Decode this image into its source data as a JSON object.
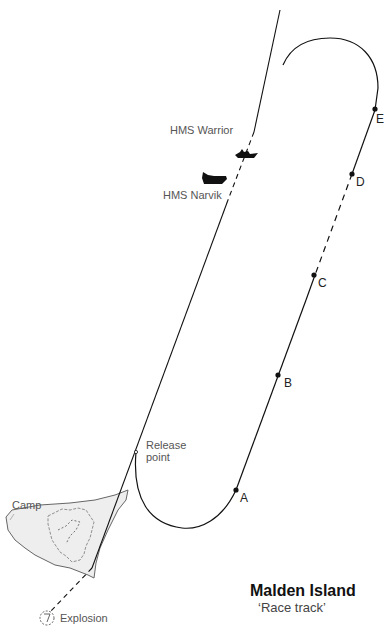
{
  "header": {
    "cut_off_title": "— — — —  — — — — — — —"
  },
  "ships": [
    {
      "name": "HMS Warrior",
      "icon": "ship-icon"
    },
    {
      "name": "HMS Narvik",
      "icon": "ship-icon"
    }
  ],
  "track_points": [
    {
      "label": "A"
    },
    {
      "label": "B"
    },
    {
      "label": "C"
    },
    {
      "label": "D"
    },
    {
      "label": "E"
    }
  ],
  "labels": {
    "release_point_line1": "Release",
    "release_point_line2": "point",
    "camp": "Camp",
    "explosion": "Explosion"
  },
  "caption": {
    "title": "Malden Island",
    "subtitle": "‘Race track’"
  },
  "colors": {
    "line": "#111111",
    "island_fill": "#eeeeee",
    "island_stroke": "#666666",
    "label_text": "#555555"
  }
}
